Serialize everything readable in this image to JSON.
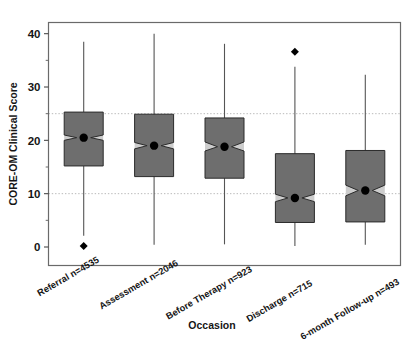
{
  "chart_data": {
    "type": "box",
    "title": "",
    "xlabel": "Occasion",
    "ylabel": "CORE-OM Clinical Score",
    "ylim": [
      -2.5,
      43
    ],
    "yticks": [
      0,
      10,
      20,
      30,
      40
    ],
    "ytick_labels": [
      "0",
      "10",
      "20",
      "30",
      "40"
    ],
    "grid": "horizontal-dotted",
    "gridlines": [
      10,
      25
    ],
    "legend": "none",
    "categories": [
      "Referral n=4535",
      "Assessment n=2046",
      "Before Therapy n=923",
      "Discharge n=715",
      "6-month Follow-up n=493"
    ],
    "boxes": [
      {
        "category": "Referral n=4535",
        "n": 4535,
        "whisker_low": 2.1,
        "q1": 15.2,
        "median": 20.5,
        "notch_low": 20.0,
        "notch_high": 21.0,
        "q3": 25.3,
        "whisker_high": 38.5,
        "outliers": [
          0.2
        ]
      },
      {
        "category": "Assessment n=2046",
        "n": 2046,
        "whisker_low": 0.4,
        "q1": 13.2,
        "median": 19.0,
        "notch_low": 18.4,
        "notch_high": 19.6,
        "q3": 24.9,
        "whisker_high": 40.0,
        "outliers": []
      },
      {
        "category": "Before Therapy n=923",
        "n": 923,
        "whisker_low": 0.5,
        "q1": 12.9,
        "median": 18.8,
        "notch_low": 18.0,
        "notch_high": 19.7,
        "q3": 24.2,
        "whisker_high": 38.1,
        "outliers": []
      },
      {
        "category": "Discharge n=715",
        "n": 715,
        "whisker_low": 0.2,
        "q1": 4.6,
        "median": 9.2,
        "notch_low": 8.5,
        "notch_high": 9.9,
        "q3": 17.5,
        "whisker_high": 33.8,
        "outliers": [
          36.6
        ]
      },
      {
        "category": "6-month Follow-up n=493",
        "n": 493,
        "whisker_low": 0.4,
        "q1": 4.7,
        "median": 10.6,
        "notch_low": 9.6,
        "notch_high": 11.6,
        "q3": 18.1,
        "whisker_high": 32.3,
        "outliers": []
      }
    ],
    "colors": {
      "box_fill": "#6e6e6e",
      "box_edge": "#2b2b2b",
      "notch_fill": "#cdcdcd",
      "median_point": "#000000",
      "whisker": "#555555",
      "gridline": "#b9b9b9",
      "frame": "#6a6a6a",
      "outlier": "#000000",
      "text": "#151515"
    }
  }
}
